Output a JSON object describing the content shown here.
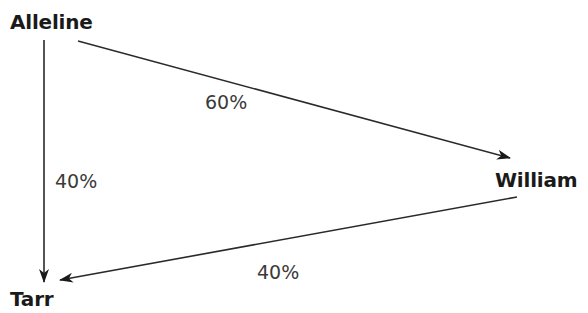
{
  "diagram": {
    "type": "directed-graph",
    "nodes": [
      {
        "id": "alleline",
        "label": "Alleline"
      },
      {
        "id": "william",
        "label": "William"
      },
      {
        "id": "tarr",
        "label": "Tarr"
      }
    ],
    "edges": [
      {
        "from": "alleline",
        "to": "william",
        "label": "60%"
      },
      {
        "from": "alleline",
        "to": "tarr",
        "label": "40%"
      },
      {
        "from": "william",
        "to": "tarr",
        "label": "40%"
      }
    ]
  }
}
